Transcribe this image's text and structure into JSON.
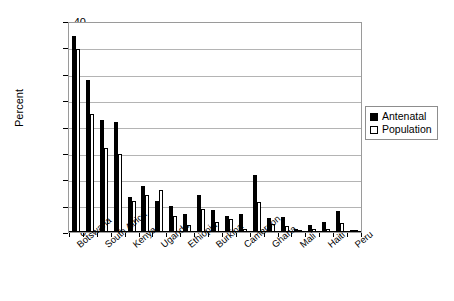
{
  "chart_data": {
    "type": "bar",
    "title": "",
    "xlabel": "",
    "ylabel": "Percent",
    "ylim": [
      0,
      40
    ],
    "yticks": [
      0,
      5,
      10,
      15,
      20,
      25,
      30,
      35,
      40
    ],
    "grid": true,
    "legend_position": "right",
    "categories": [
      "Botswana",
      "",
      "South Africa",
      "",
      "Kenya",
      "",
      "Uganda",
      "",
      "Ethiopia",
      "",
      "Burkina",
      "",
      "Cameroon",
      "",
      "Ghana",
      "",
      "Mali",
      "",
      "Haiti",
      "",
      "Peru"
    ],
    "tick_labels": [
      "Botswana",
      "South Africa",
      "Kenya",
      "Uganda",
      "Ethiopia",
      "Burkina",
      "Cameroon",
      "Ghana",
      "Mali",
      "Haiti",
      "Peru"
    ],
    "series": [
      {
        "name": "Antenatal",
        "color": "#000000",
        "values": [
          37.5,
          29.0,
          21.5,
          21.0,
          6.7,
          8.8,
          6.0,
          5.0,
          3.4,
          7.0,
          4.2,
          3.0,
          3.5,
          11.0,
          2.7,
          2.9,
          0.6,
          1.4,
          1.9,
          4.0,
          0.3
        ]
      },
      {
        "name": "Population",
        "color": "#ffffff",
        "values": [
          35.0,
          22.5,
          16.0,
          15.0,
          6.0,
          7.0,
          8.0,
          3.0,
          1.4,
          4.5,
          1.9,
          2.5,
          0.6,
          5.7,
          1.5,
          1.2,
          0.3,
          0.5,
          0.5,
          1.8,
          0.2
        ]
      }
    ]
  },
  "legend": {
    "items": [
      {
        "label": "Antenatal",
        "swatch": "filled-black-square"
      },
      {
        "label": "Population",
        "swatch": "open-white-square"
      }
    ]
  },
  "axes": {
    "y_title": "Percent",
    "y_tick_labels": [
      "40",
      "35",
      "30",
      "25",
      "20",
      "15",
      "10",
      "5",
      "0"
    ]
  }
}
